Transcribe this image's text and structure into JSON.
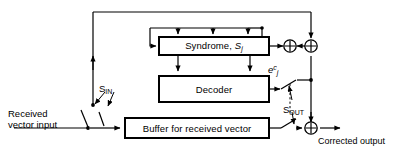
{
  "diagram": {
    "blocks": {
      "syndrome": {
        "label_main": "Syndrome,",
        "label_var": "S",
        "label_sub": "j"
      },
      "decoder": {
        "label": "Decoder"
      },
      "buffer": {
        "label": "Buffer for received vector"
      }
    },
    "labels": {
      "received_line1": "Received",
      "received_line2": "vector input",
      "corrected_output": "Corrected output",
      "switch_in_main": "S",
      "switch_in_sub": "IN",
      "switch_out_main": "S",
      "switch_out_sub": "OUT",
      "error_var": "e",
      "error_sup": "c",
      "error_sub": "j"
    },
    "nodes": {
      "adder_left": "xor-adder",
      "adder_right": "xor-adder",
      "adder_bottom": "xor-adder"
    },
    "colors": {
      "ink": "#000000",
      "background": "#ffffff",
      "block_fill": "#ffffff"
    }
  }
}
